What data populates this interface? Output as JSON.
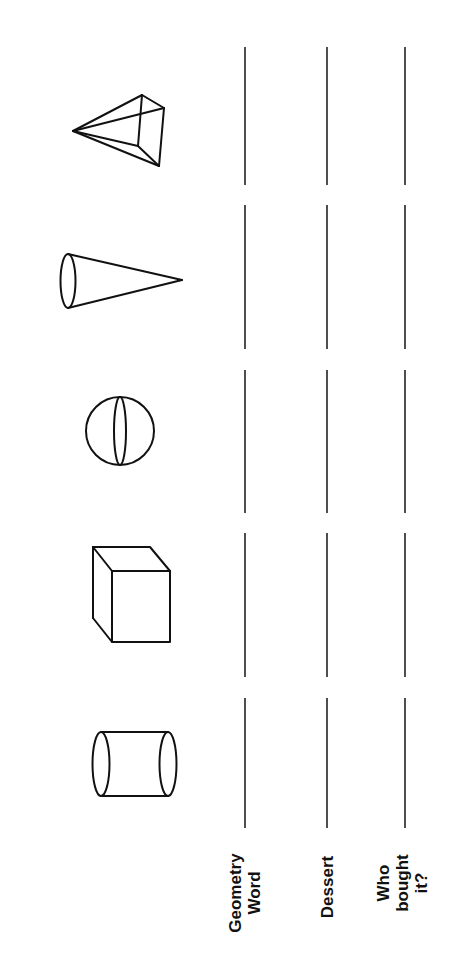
{
  "worksheet": {
    "orientation": "rotated-90-ccw",
    "shapes": [
      {
        "name": "cylinder",
        "order": 1
      },
      {
        "name": "cube",
        "order": 2
      },
      {
        "name": "sphere",
        "order": 3
      },
      {
        "name": "cone",
        "order": 4
      },
      {
        "name": "pyramid",
        "order": 5
      }
    ],
    "rows": [
      {
        "label_line1": "Geometry",
        "label_line2": "Word",
        "answers": [
          "",
          "",
          "",
          "",
          ""
        ]
      },
      {
        "label_line1": "Dessert",
        "label_line2": "",
        "answers": [
          "",
          "",
          "",
          "",
          ""
        ]
      },
      {
        "label_line1": "Who",
        "label_line2": "bought",
        "label_line3": "it?",
        "answers": [
          "",
          "",
          "",
          "",
          ""
        ]
      }
    ],
    "colors": {
      "ink": "#111111",
      "background": "#ffffff"
    }
  }
}
